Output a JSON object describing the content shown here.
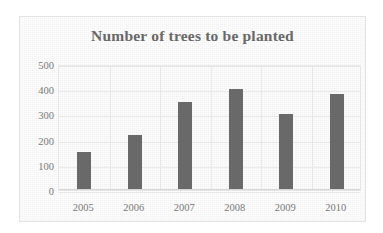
{
  "chart_data": {
    "type": "bar",
    "title": "Number of trees to be planted",
    "xlabel": "",
    "ylabel": "",
    "categories": [
      "2005",
      "2006",
      "2007",
      "2008",
      "2009",
      "2010"
    ],
    "values": [
      150,
      220,
      350,
      400,
      300,
      380
    ],
    "ylim": [
      0,
      500
    ],
    "yticks": [
      0,
      100,
      200,
      300,
      400,
      500
    ],
    "ytick_labels": [
      "0",
      "100",
      "200",
      "300",
      "400",
      "500"
    ],
    "grid": true,
    "legend": null,
    "legend_position": "none",
    "series": [
      {
        "name": "Number of trees to be planted",
        "values": [
          150,
          220,
          350,
          400,
          300,
          380
        ]
      }
    ],
    "colors": {
      "bar": "#6b6b6b",
      "title": "#6a6a6a",
      "tick_label": "#7a7a7a",
      "gridline": "#ededed",
      "plot_background": "#fdfdfd",
      "frame_border": "#e3e3e3"
    }
  }
}
